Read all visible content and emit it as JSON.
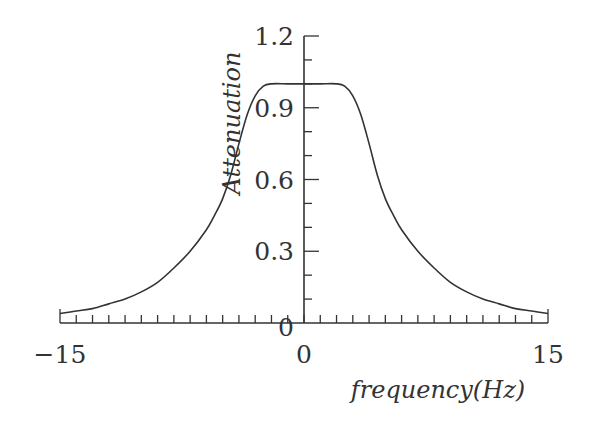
{
  "chart_data": {
    "type": "line",
    "title": "",
    "xlabel": "frequency(Hz)",
    "ylabel": "Attenuation",
    "xlim": [
      -15,
      15
    ],
    "ylim": [
      0,
      1.2
    ],
    "x_ticks_major": [
      -15,
      0,
      15
    ],
    "x_tick_labels": [
      "−15",
      "0",
      "15"
    ],
    "x_minor_step": 1,
    "y_ticks_major": [
      0,
      0.3,
      0.6,
      0.9,
      1.2
    ],
    "y_tick_labels": [
      "0",
      "0.3",
      "0.6",
      "0.9",
      "1.2"
    ],
    "y_minor_step": 0.1,
    "grid": false,
    "legend": "none",
    "series": [
      {
        "name": "Attenuation",
        "x": [
          -15,
          -14,
          -13,
          -12,
          -11,
          -10,
          -9,
          -8,
          -7,
          -6,
          -5.5,
          -5,
          -4.5,
          -4,
          -3.5,
          -3,
          -2.5,
          -2,
          -1,
          0,
          1,
          2,
          2.5,
          3,
          3.5,
          4,
          4.5,
          5,
          5.5,
          6,
          7,
          8,
          9,
          10,
          11,
          12,
          13,
          14,
          15
        ],
        "values": [
          0.04,
          0.05,
          0.06,
          0.08,
          0.1,
          0.13,
          0.17,
          0.23,
          0.3,
          0.39,
          0.45,
          0.52,
          0.62,
          0.75,
          0.87,
          0.95,
          0.99,
          1.0,
          1.0,
          1.0,
          1.0,
          1.0,
          0.99,
          0.95,
          0.87,
          0.75,
          0.62,
          0.52,
          0.45,
          0.39,
          0.3,
          0.23,
          0.17,
          0.13,
          0.1,
          0.08,
          0.06,
          0.05,
          0.04
        ]
      }
    ]
  }
}
